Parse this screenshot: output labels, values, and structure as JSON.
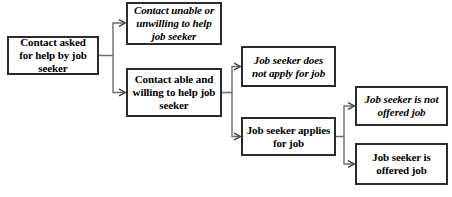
{
  "diagram": {
    "background_color": "#ffffff",
    "box_border_color": "#2b2b2b",
    "connector_color": "#6e6e6e",
    "text_color": "#000000",
    "nodes": [
      {
        "id": "contact-asked",
        "label": "Contact asked for help by job seeker",
        "style": "upright",
        "x": 7,
        "y": 36,
        "width": 92,
        "height": 39
      },
      {
        "id": "contact-unable",
        "label": "Contact unable or unwilling to help job seeker",
        "style": "italic",
        "x": 126,
        "y": 2,
        "width": 96,
        "height": 43
      },
      {
        "id": "contact-able",
        "label": "Contact able and willing to help job seeker",
        "style": "upright",
        "x": 126,
        "y": 68,
        "width": 96,
        "height": 49
      },
      {
        "id": "does-not-apply",
        "label": "Job seeker does not apply for job",
        "style": "italic",
        "x": 241,
        "y": 46,
        "width": 95,
        "height": 41
      },
      {
        "id": "applies-for-job",
        "label": "Job seeker applies for job",
        "style": "upright",
        "x": 241,
        "y": 117,
        "width": 95,
        "height": 39
      },
      {
        "id": "not-offered",
        "label": "Job seeker is not offered job",
        "style": "italic",
        "x": 355,
        "y": 86,
        "width": 93,
        "height": 40
      },
      {
        "id": "offered",
        "label": "Job seeker is offered job",
        "style": "upright",
        "x": 355,
        "y": 143,
        "width": 93,
        "height": 42
      }
    ],
    "edges": [
      {
        "id": "edge-asked-to-unable",
        "from": "contact-asked",
        "to": "contact-unable"
      },
      {
        "id": "edge-asked-to-able",
        "from": "contact-asked",
        "to": "contact-able"
      },
      {
        "id": "edge-able-to-not-apply",
        "from": "contact-able",
        "to": "does-not-apply"
      },
      {
        "id": "edge-able-to-applies",
        "from": "contact-able",
        "to": "applies-for-job"
      },
      {
        "id": "edge-applies-to-not-offered",
        "from": "applies-for-job",
        "to": "not-offered"
      },
      {
        "id": "edge-applies-to-offered",
        "from": "applies-for-job",
        "to": "offered"
      }
    ]
  }
}
